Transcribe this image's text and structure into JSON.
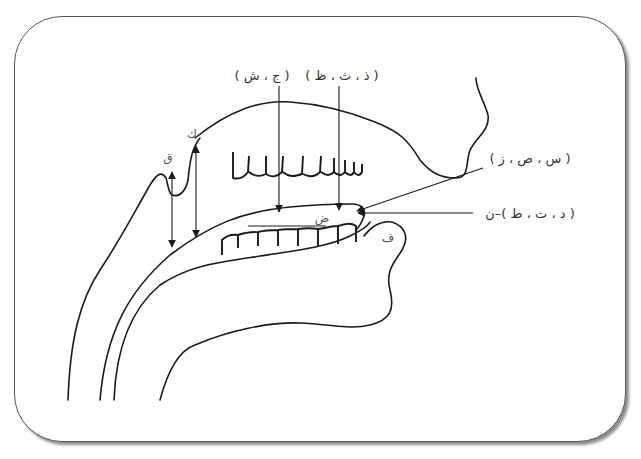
{
  "figure": {
    "type": "articulation-points-diagram",
    "frame_color": "#555555",
    "line_color": "#1a1a1a",
    "text_color": "#333333"
  },
  "labels": {
    "top_left_group": "( ج ، ش )",
    "top_right_group": "( ذ ، ث ، ظ )",
    "right_upper_group": "( س ، ص ، ز )",
    "right_lower_group": "( د ، ت ، ط )–ن",
    "qaf": "ق",
    "kaf": "ك",
    "dad": "ض",
    "fa": "ف"
  },
  "annotations": [
    {
      "id": "qaf",
      "letter": "ق",
      "region": "uvula / back of tongue"
    },
    {
      "id": "kaf",
      "letter": "ك",
      "region": "soft palate"
    },
    {
      "id": "jim-shin",
      "letters": "( ج ، ش )",
      "region": "middle of tongue to hard palate"
    },
    {
      "id": "dhal-tha-za",
      "letters": "( ذ ، ث ، ظ )",
      "region": "tip of tongue to upper incisors"
    },
    {
      "id": "sin-sad-zay",
      "letters": "( س ، ص ، ز )",
      "region": "tip of tongue behind incisors"
    },
    {
      "id": "dal-ta-tta-nun",
      "letters": "( د ، ت ، ط )–ن",
      "region": "tip of tongue to gum ridge"
    },
    {
      "id": "dad",
      "letter": "ض",
      "region": "side of tongue"
    },
    {
      "id": "fa",
      "letter": "ف",
      "region": "lower lip"
    }
  ]
}
